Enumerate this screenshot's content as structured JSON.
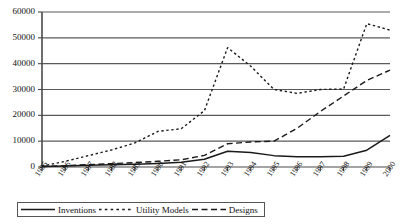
{
  "chart_data": {
    "type": "line",
    "title": "",
    "subtitle": "",
    "xlabel": "",
    "ylabel": "",
    "grid": true,
    "legend_position": "bottom",
    "xlim": [
      1985,
      2000
    ],
    "ylim": [
      0,
      60000
    ],
    "ytick_values": [
      0,
      10000,
      20000,
      30000,
      40000,
      50000,
      60000
    ],
    "ytick_labels": [
      "0",
      "10000",
      "20000",
      "30000",
      "40000",
      "50000",
      "60000"
    ],
    "categories": [
      1985,
      1986,
      1987,
      1988,
      1989,
      1990,
      1991,
      1992,
      1993,
      1994,
      1995,
      1996,
      1997,
      1998,
      1999,
      2000
    ],
    "xtick_labels": [
      "1985",
      "1986",
      "1987",
      "1988",
      "1989",
      "1990",
      "1991",
      "1992",
      "1993",
      "1994",
      "1995",
      "1996",
      "1997",
      "1998",
      "1999",
      "2000"
    ],
    "series": [
      {
        "name": "Inventions",
        "style": "solid",
        "color": "#1a1a1a",
        "values": [
          200,
          400,
          700,
          900,
          1100,
          1400,
          1800,
          3000,
          6100,
          5600,
          4400,
          4000,
          4000,
          4200,
          6500,
          12200
        ]
      },
      {
        "name": "Utility Models",
        "style": "dotted",
        "color": "#1a1a1a",
        "values": [
          300,
          2200,
          4400,
          6600,
          9300,
          13800,
          14800,
          21800,
          46200,
          39000,
          30000,
          28500,
          30000,
          30200,
          55500,
          53000
        ]
      },
      {
        "name": "Designs",
        "style": "dashed",
        "color": "#1a1a1a",
        "values": [
          200,
          500,
          900,
          1300,
          1700,
          2200,
          2800,
          4500,
          9000,
          9700,
          10000,
          15000,
          21500,
          27500,
          33500,
          37500
        ]
      }
    ]
  },
  "legend": {
    "items": [
      {
        "label": "Inventions",
        "style": "solid"
      },
      {
        "label": "Utility Models",
        "style": "dotted"
      },
      {
        "label": "Designs",
        "style": "dashed"
      }
    ]
  }
}
